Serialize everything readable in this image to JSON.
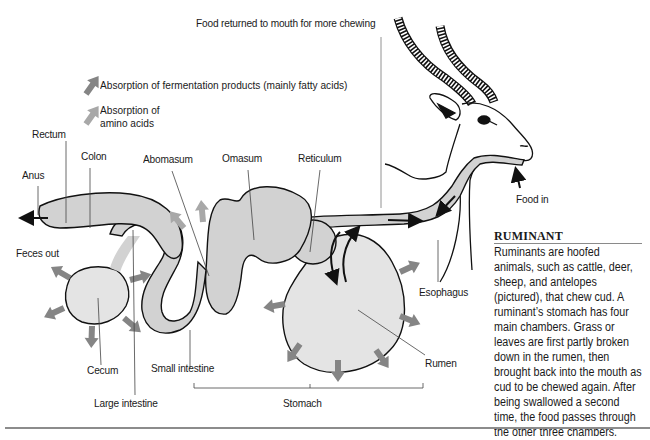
{
  "diagram": {
    "title_annotation": "Food returned to mouth for more chewing",
    "legend": [
      {
        "icon": "dark-gray-arrow-icon",
        "color": "#7d7d7d",
        "label": "Absorption of fermentation products (mainly fatty acids)"
      },
      {
        "icon": "light-gray-arrow-icon",
        "color": "#a9a9a9",
        "label_line1": "Absorption of",
        "label_line2": "amino acids"
      }
    ],
    "labels": {
      "rectum": "Rectum",
      "colon": "Colon",
      "anus": "Anus",
      "feces_out": "Feces out",
      "abomasum": "Abomasum",
      "omasum": "Omasum",
      "reticulum": "Reticulum",
      "food_in": "Food in",
      "esophagus": "Esophagus",
      "cecum": "Cecum",
      "small_intestine": "Small intestine",
      "large_intestine": "Large intestine",
      "rumen": "Rumen",
      "stomach": "Stomach"
    },
    "colors": {
      "organ_fill": "#d2d2d2",
      "rumen_fill": "#e4e4e4",
      "outline": "#111111",
      "absorption_arrow": "#858585",
      "leader_line": "#555555"
    }
  },
  "sidebar": {
    "title": "RUMINANT",
    "body": "Ruminants are hoofed animals, such as cattle, deer, sheep, and antelopes (pictured), that chew cud. A ruminant’s stomach has four main chambers. Grass or leaves are first partly broken down in the rumen, then brought back into the mouth as cud to be chewed again. After being swallowed a second time, the food passes through the other three chambers."
  }
}
